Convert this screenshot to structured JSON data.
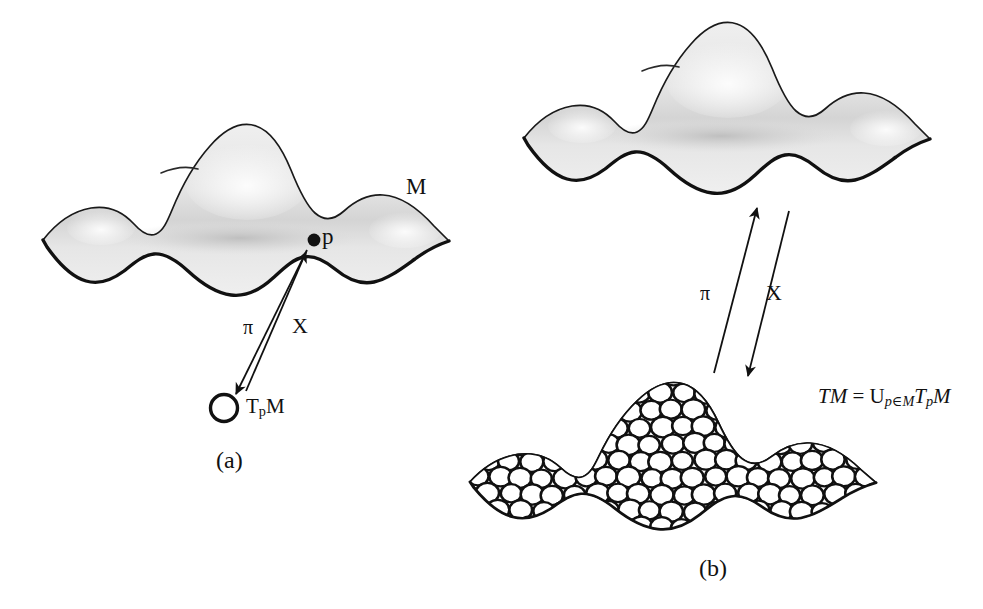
{
  "figure": {
    "background_color": "#ffffff",
    "ink_color": "#111111",
    "surface_fill": "#e9e9e9",
    "surface_shadow": "#c9c9c9"
  },
  "panel_a": {
    "caption": "(a)",
    "manifold_label": "M",
    "point_label": "p",
    "projection_label": "π",
    "section_label": "X",
    "tangent_space_label_main": "T",
    "tangent_space_label_sub": "p",
    "tangent_space_label_tail": "M"
  },
  "panel_b": {
    "caption": "(b)",
    "projection_label": "π",
    "section_label": "X",
    "equation": {
      "lhs": "TM",
      "equals": " = ",
      "union_symbol": "U",
      "union_subscript": "p∈M",
      "rhs_main": "T",
      "rhs_sub": "p",
      "rhs_tail": "M",
      "full_text": "TM = U_{p∈M} T_p M"
    }
  },
  "chart_data": {
    "type": "diagram",
    "panels": [
      {
        "id": "a",
        "caption": "(a)",
        "description": "A manifold M with a marked point p and its tangent space T_p M drawn below as a small circle; two arrows labelled pi (downward, projection) and X (upward, section) connect them.",
        "elements": [
          "manifold-surface",
          "point-p",
          "tangent-space-circle",
          "pi-arrow",
          "X-arrow"
        ],
        "labels": [
          "M",
          "p",
          "π",
          "X",
          "T_p M",
          "(a)"
        ]
      },
      {
        "id": "b",
        "caption": "(b)",
        "description": "The same manifold M above, and below it the whole tangent bundle TM rendered as the manifold shape packed with circles; pi and X arrows connect the two.",
        "elements": [
          "manifold-surface",
          "sphere-packed-bundle",
          "pi-arrow",
          "X-arrow",
          "equation"
        ],
        "labels": [
          "π",
          "X",
          "TM = U_{p∈M} T_p M",
          "(b)"
        ]
      }
    ]
  }
}
